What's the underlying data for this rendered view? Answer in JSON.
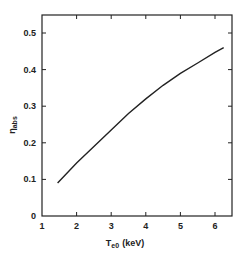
{
  "chart_data": {
    "type": "line",
    "title": "",
    "xlabel": "T_e0 (keV)",
    "xlabel_main": "T",
    "xlabel_sub": "e0",
    "xlabel_unit": "(keV)",
    "ylabel": "η_abs",
    "ylabel_main": "η",
    "ylabel_sub": "abs",
    "xlim": [
      1,
      6.5
    ],
    "ylim": [
      0,
      0.55
    ],
    "xticks": [
      1,
      2,
      3,
      4,
      5,
      6
    ],
    "xtick_labels": [
      "1",
      "2",
      "3",
      "4",
      "5",
      "6"
    ],
    "yticks": [
      0,
      0.1,
      0.2,
      0.3,
      0.4,
      0.5
    ],
    "ytick_labels": [
      "0",
      "0.1",
      "0.2",
      "0.3",
      "0.4",
      "0.5"
    ],
    "grid": false,
    "legend": null,
    "series": [
      {
        "name": "eta_abs",
        "x": [
          1.45,
          2.0,
          2.5,
          3.0,
          3.5,
          4.0,
          4.5,
          5.0,
          5.5,
          6.0,
          6.25
        ],
        "y": [
          0.09,
          0.145,
          0.19,
          0.235,
          0.28,
          0.32,
          0.357,
          0.39,
          0.418,
          0.447,
          0.46
        ]
      }
    ]
  }
}
